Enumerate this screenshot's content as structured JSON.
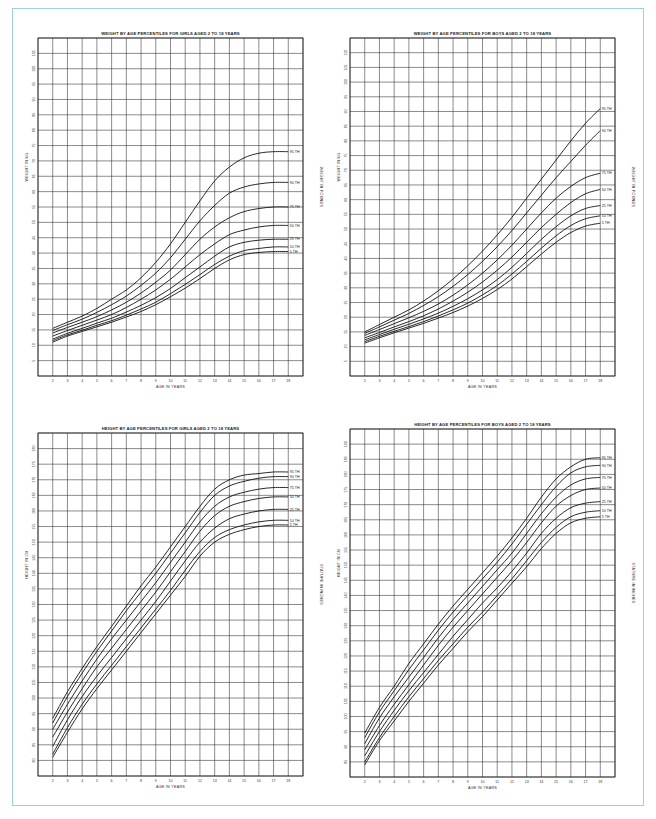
{
  "page": {
    "frame_color": "#9fd0e0"
  },
  "chart_data": [
    {
      "id": "girls_weight",
      "type": "line",
      "title": "WEIGHT BY AGE PERCENTILES FOR GIRLS AGED 2 TO 18 YEARS",
      "xlabel": "AGE IN YEARS",
      "ylabel": "WEIGHT IN KG",
      "ylabel_right": "WEIGHT IN POUNDS",
      "x": [
        2,
        3,
        4,
        5,
        6,
        7,
        8,
        9,
        10,
        11,
        12,
        13,
        14,
        15,
        16,
        17,
        18
      ],
      "xlim": [
        1,
        19
      ],
      "ylim": [
        0,
        110
      ],
      "ytick_step": 5,
      "yticks": [
        5,
        10,
        15,
        20,
        25,
        30,
        35,
        40,
        45,
        50,
        55,
        60,
        65,
        70,
        75,
        80,
        85,
        90,
        95,
        100,
        105
      ],
      "grid": true,
      "series": [
        {
          "name": "95 TH",
          "values": [
            15.5,
            17.5,
            19.5,
            22,
            25,
            28,
            32,
            37,
            43,
            50,
            57,
            63.5,
            68,
            71,
            72.5,
            73,
            73
          ]
        },
        {
          "name": "90 TH",
          "values": [
            14.8,
            16.7,
            18.5,
            20.7,
            23.2,
            26,
            29.5,
            33.5,
            38.5,
            44.5,
            50.5,
            55.5,
            59.5,
            61.5,
            62.5,
            63,
            63
          ]
        },
        {
          "name": "75 TH",
          "values": [
            14,
            15.8,
            17.5,
            19.3,
            21.5,
            24,
            27,
            30.5,
            34.5,
            39.5,
            44.5,
            48.5,
            51.5,
            53.5,
            54.5,
            55,
            55
          ]
        },
        {
          "name": "50 TH",
          "values": [
            13,
            14.8,
            16.5,
            18.2,
            20,
            22.3,
            25,
            28,
            31.5,
            35.5,
            39.5,
            43,
            46,
            47.5,
            48.5,
            49,
            49
          ]
        },
        {
          "name": "25 TH",
          "values": [
            12,
            13.9,
            15.5,
            17.2,
            18.8,
            20.8,
            23,
            25.5,
            28.5,
            32,
            35.5,
            39,
            42,
            43.5,
            44.2,
            44.5,
            44.5
          ]
        },
        {
          "name": "10 TH",
          "values": [
            11.5,
            13.4,
            14.9,
            16.5,
            18,
            19.8,
            21.8,
            24,
            26.8,
            29.8,
            33,
            36.3,
            39,
            40.8,
            41.5,
            42,
            42
          ]
        },
        {
          "name": "5 TH",
          "values": [
            11,
            13,
            14.5,
            16,
            17.5,
            19.2,
            21,
            23.2,
            25.8,
            28.6,
            31.7,
            35,
            37.8,
            39.5,
            40.2,
            40.5,
            40.5
          ]
        }
      ]
    },
    {
      "id": "boys_weight",
      "type": "line",
      "title": "WEIGHT BY AGE PERCENTILES FOR BOYS AGED 2 TO 18 YEARS",
      "xlabel": "AGE IN YEARS",
      "ylabel": "WEIGHT IN KG",
      "ylabel_right": "WEIGHT IN POUNDS",
      "x": [
        2,
        3,
        4,
        5,
        6,
        7,
        8,
        9,
        10,
        11,
        12,
        13,
        14,
        15,
        16,
        17,
        18
      ],
      "xlim": [
        1,
        19
      ],
      "ylim": [
        0,
        115
      ],
      "ytick_step": 5,
      "yticks": [
        5,
        10,
        15,
        20,
        25,
        30,
        35,
        40,
        45,
        50,
        55,
        60,
        65,
        70,
        75,
        80,
        85,
        90,
        95,
        100,
        105,
        110
      ],
      "grid": true,
      "series": [
        {
          "name": "95 TH",
          "values": [
            15,
            17.5,
            20,
            22.5,
            25.5,
            29,
            33,
            37.5,
            42.5,
            48,
            54,
            60.5,
            67,
            73.5,
            80,
            86,
            91
          ]
        },
        {
          "name": "90 TH",
          "values": [
            14.5,
            16.7,
            19,
            21.3,
            24,
            27,
            30.5,
            34.5,
            39,
            44,
            49.5,
            55.5,
            61.5,
            67.5,
            73,
            78.5,
            83.5
          ]
        },
        {
          "name": "75 TH",
          "values": [
            13.8,
            15.8,
            17.8,
            19.8,
            22,
            24.5,
            27.5,
            31,
            35,
            39.5,
            44.5,
            50,
            55.5,
            60.5,
            64.5,
            67.5,
            69
          ]
        },
        {
          "name": "50 TH",
          "values": [
            13,
            14.8,
            16.7,
            18.5,
            20.5,
            22.8,
            25.5,
            28.5,
            32,
            36,
            40.5,
            45.5,
            50.5,
            55,
            59,
            62,
            63.5
          ]
        },
        {
          "name": "25 TH",
          "values": [
            12.3,
            14.1,
            15.9,
            17.6,
            19.4,
            21.4,
            23.7,
            26.3,
            29.3,
            32.8,
            37,
            41.7,
            46.5,
            50.8,
            54.5,
            57,
            58
          ]
        },
        {
          "name": "10 TH",
          "values": [
            11.7,
            13.5,
            15.2,
            16.8,
            18.5,
            20.4,
            22.5,
            24.8,
            27.6,
            30.8,
            34.7,
            39,
            43.5,
            47.7,
            51.2,
            53.5,
            54.5
          ]
        },
        {
          "name": "5 TH",
          "values": [
            11.2,
            13,
            14.7,
            16.3,
            17.9,
            19.7,
            21.6,
            23.8,
            26.4,
            29.4,
            33,
            37.2,
            41.5,
            45.5,
            48.8,
            51,
            52
          ]
        }
      ]
    },
    {
      "id": "girls_height",
      "type": "line",
      "title": "HEIGHT BY AGE PERCENTILES FOR GIRLS AGED 2 TO 18 YEARS",
      "xlabel": "AGE IN YEARS",
      "ylabel": "HEIGHT IN CM",
      "ylabel_right": "STATURE IN INCHES",
      "x": [
        2,
        3,
        4,
        5,
        6,
        7,
        8,
        9,
        10,
        11,
        12,
        13,
        14,
        15,
        16,
        17,
        18
      ],
      "xlim": [
        1,
        19
      ],
      "ylim": [
        75,
        185
      ],
      "ytick_step": 5,
      "yticks": [
        80,
        85,
        90,
        95,
        100,
        105,
        110,
        115,
        120,
        125,
        130,
        135,
        140,
        145,
        150,
        155,
        160,
        165,
        170,
        175,
        180
      ],
      "grid": true,
      "series": [
        {
          "name": "95 TH",
          "values": [
            93.5,
            102,
            109.5,
            116.5,
            123,
            129.5,
            136,
            142,
            148.5,
            155,
            161.5,
            167,
            170,
            171.5,
            172,
            172.5,
            172.5
          ]
        },
        {
          "name": "90 TH",
          "values": [
            92,
            100.5,
            108,
            115,
            121.5,
            128,
            134,
            140,
            146.5,
            153,
            159.5,
            165,
            168,
            169.5,
            170.5,
            171,
            171
          ]
        },
        {
          "name": "75 TH",
          "values": [
            90,
            98,
            105.5,
            112.5,
            119,
            125,
            131,
            137,
            143.5,
            150,
            156.5,
            161.5,
            164.5,
            166,
            167,
            167.5,
            167.5
          ]
        },
        {
          "name": "50 TH",
          "values": [
            87.5,
            95.5,
            103,
            110,
            116,
            122,
            128,
            134,
            140.5,
            147,
            153.5,
            158.5,
            161.5,
            163,
            164,
            164.5,
            164.5
          ]
        },
        {
          "name": "25 TH",
          "values": [
            84.5,
            93,
            100.5,
            107,
            113,
            119,
            125,
            131,
            137.5,
            144,
            150,
            154.5,
            157.5,
            159,
            160,
            160.5,
            160.5
          ]
        },
        {
          "name": "10 TH",
          "values": [
            82,
            90.5,
            98,
            104.5,
            110.5,
            116.5,
            122.5,
            128.5,
            134.5,
            141,
            147,
            151.5,
            154,
            155.5,
            156.5,
            157,
            157
          ]
        },
        {
          "name": "5 TH",
          "values": [
            81,
            89,
            96.5,
            103,
            109,
            115,
            121,
            127,
            133,
            139,
            145.5,
            150,
            152.5,
            154,
            155,
            155.5,
            155.5
          ]
        }
      ]
    },
    {
      "id": "boys_height",
      "type": "line",
      "title": "HEIGHT BY AGE PERCENTILES FOR BOYS AGED 2 TO 18 YEARS",
      "xlabel": "AGE IN YEARS",
      "ylabel": "HEIGHT IN CM",
      "ylabel_right": "STATURE IN INCHES",
      "x": [
        2,
        3,
        4,
        5,
        6,
        7,
        8,
        9,
        10,
        11,
        12,
        13,
        14,
        15,
        16,
        17,
        18
      ],
      "xlim": [
        1,
        19
      ],
      "ylim": [
        80,
        195
      ],
      "ytick_step": 5,
      "yticks": [
        85,
        90,
        95,
        100,
        105,
        110,
        115,
        120,
        125,
        130,
        135,
        140,
        145,
        150,
        155,
        160,
        165,
        170,
        175,
        180,
        185,
        190
      ],
      "grid": true,
      "series": [
        {
          "name": "95 TH",
          "values": [
            94.5,
            103,
            110,
            117.5,
            124,
            130.5,
            136.5,
            142,
            147.5,
            153,
            159,
            165.5,
            172.5,
            178.5,
            182.5,
            185,
            185.5
          ]
        },
        {
          "name": "90 TH",
          "values": [
            93,
            101.5,
            108.5,
            115.5,
            122,
            128.5,
            134.5,
            140,
            145.5,
            151,
            157,
            163.5,
            170,
            176,
            180.5,
            182.5,
            183
          ]
        },
        {
          "name": "75 TH",
          "values": [
            91,
            99.5,
            106.5,
            113,
            119.5,
            126,
            132,
            137.5,
            143,
            148.5,
            154,
            160.5,
            167,
            172.5,
            176.5,
            178.5,
            179
          ]
        },
        {
          "name": "50 TH",
          "values": [
            89,
            97,
            104,
            110.5,
            117,
            123.5,
            129.5,
            135,
            140.5,
            146,
            151.5,
            157.5,
            164,
            169.5,
            173,
            175,
            175.5
          ]
        },
        {
          "name": "25 TH",
          "values": [
            87,
            95,
            102,
            108.5,
            114.5,
            120.5,
            126.5,
            132,
            137.5,
            142.5,
            148,
            154,
            160.5,
            165.5,
            169,
            170.5,
            171
          ]
        },
        {
          "name": "10 TH",
          "values": [
            85,
            93,
            100,
            106.5,
            112.5,
            118.5,
            124,
            129.5,
            134.5,
            140,
            145.5,
            151.5,
            157.5,
            162.5,
            166,
            167.5,
            168
          ]
        },
        {
          "name": "5 TH",
          "values": [
            84,
            92,
            98.5,
            105,
            111,
            117,
            122.5,
            128,
            133,
            138.5,
            144,
            149.5,
            155.5,
            160.5,
            164,
            165.5,
            166
          ]
        }
      ]
    }
  ]
}
